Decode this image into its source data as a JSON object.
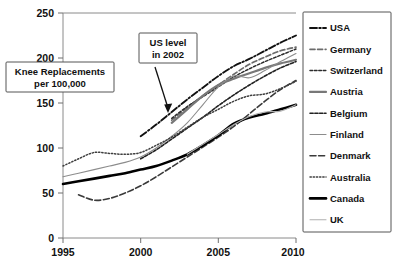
{
  "chart_data": {
    "type": "line",
    "title": "",
    "xlabel": "",
    "ylabel": "Knee Replacements per 100,000",
    "xlim": [
      1995,
      2010
    ],
    "ylim": [
      0,
      250
    ],
    "xticks": [
      "1995",
      "2000",
      "2005",
      "2010"
    ],
    "yticks": [
      "0",
      "50",
      "100",
      "150",
      "200",
      "250"
    ],
    "grid": false,
    "legend_position": "right",
    "annotations": [
      {
        "name": "us-level-2002",
        "line1": "US level",
        "line2": "in 2002",
        "points_to_x": 2002,
        "points_to_y": 140
      }
    ],
    "series": [
      {
        "name": "USA",
        "color": "#111111",
        "style": "dash-dot",
        "x": [
          2000,
          2001,
          2002,
          2003,
          2004,
          2005,
          2006,
          2007,
          2008,
          2009,
          2010
        ],
        "values": [
          113,
          126,
          140,
          154,
          167,
          180,
          191,
          199,
          208,
          217,
          225
        ]
      },
      {
        "name": "Germany",
        "color": "#6b6b6b",
        "style": "dashed",
        "x": [
          2002,
          2003,
          2004,
          2005,
          2006,
          2007,
          2008,
          2009,
          2010
        ],
        "values": [
          131,
          145,
          158,
          170,
          182,
          193,
          201,
          208,
          212
        ]
      },
      {
        "name": "Switzerland",
        "color": "#2b2b2b",
        "style": "fine-dash",
        "x": [
          2002,
          2003,
          2004,
          2005,
          2006,
          2007,
          2008,
          2009,
          2010
        ],
        "values": [
          133,
          146,
          157,
          168,
          179,
          188,
          196,
          203,
          210
        ]
      },
      {
        "name": "Austria",
        "color": "#787878",
        "style": "solid-thick",
        "x": [
          2002,
          2003,
          2004,
          2005,
          2006,
          2007,
          2008,
          2009,
          2010
        ],
        "values": [
          128,
          143,
          158,
          170,
          177,
          183,
          189,
          194,
          198
        ]
      },
      {
        "name": "Belgium",
        "color": "#222222",
        "style": "dotted-dash",
        "x": [
          2000,
          2001,
          2002,
          2003,
          2004,
          2005,
          2006,
          2007,
          2008,
          2009,
          2010
        ],
        "values": [
          88,
          98,
          110,
          122,
          134,
          147,
          159,
          170,
          180,
          189,
          196
        ]
      },
      {
        "name": "Finland",
        "color": "#8c8c8c",
        "style": "solid-thin",
        "x": [
          1995,
          1996,
          1997,
          1998,
          1999,
          2000,
          2001,
          2002,
          2003,
          2004,
          2005,
          2006,
          2007,
          2008,
          2009,
          2010
        ],
        "values": [
          68,
          72,
          76,
          80,
          84,
          90,
          100,
          113,
          128,
          148,
          168,
          180,
          178,
          186,
          196,
          205
        ]
      },
      {
        "name": "Denmark",
        "color": "#3a3a3a",
        "style": "long-dash",
        "x": [
          1996,
          1997,
          1998,
          1999,
          2000,
          2001,
          2002,
          2003,
          2004,
          2005,
          2006,
          2007,
          2008,
          2009,
          2010
        ],
        "values": [
          48,
          42,
          44,
          50,
          58,
          68,
          79,
          90,
          101,
          112,
          124,
          138,
          152,
          165,
          175
        ]
      },
      {
        "name": "Australia",
        "color": "#3f3f3f",
        "style": "dotted",
        "x": [
          1995,
          1996,
          1997,
          1998,
          1999,
          2000,
          2001,
          2002,
          2003,
          2004,
          2005,
          2006,
          2007,
          2008,
          2009,
          2010
        ],
        "values": [
          80,
          88,
          95,
          94,
          93,
          95,
          103,
          112,
          123,
          134,
          143,
          152,
          158,
          160,
          166,
          174
        ]
      },
      {
        "name": "Canada",
        "color": "#000000",
        "style": "solid-heavy",
        "x": [
          1995,
          1996,
          1997,
          1998,
          1999,
          2000,
          2001,
          2002,
          2003,
          2004,
          2005,
          2006,
          2007,
          2008,
          2009,
          2010
        ],
        "values": [
          60,
          63,
          66,
          69,
          72,
          76,
          80,
          86,
          93,
          103,
          114,
          127,
          134,
          138,
          143,
          148
        ]
      },
      {
        "name": "UK",
        "color": "#b0b0b0",
        "style": "solid-thin-light",
        "x": [
          2003,
          2004,
          2005,
          2006,
          2007,
          2008,
          2009,
          2010
        ],
        "values": [
          93,
          104,
          115,
          126,
          135,
          140,
          141,
          148
        ]
      }
    ]
  },
  "axis_label_box": {
    "line1": "Knee Replacements",
    "line2": "per 100,000"
  },
  "legend": {
    "items": [
      {
        "label": "USA"
      },
      {
        "label": "Germany"
      },
      {
        "label": "Switzerland"
      },
      {
        "label": "Austria"
      },
      {
        "label": "Belgium"
      },
      {
        "label": "Finland"
      },
      {
        "label": "Denmark"
      },
      {
        "label": "Australia"
      },
      {
        "label": "Canada"
      },
      {
        "label": "UK"
      }
    ]
  },
  "x_axis": {
    "labels": [
      "1995",
      "2000",
      "2005",
      "2010"
    ]
  },
  "y_axis": {
    "labels": [
      "250",
      "200",
      "150",
      "100",
      "50",
      "0"
    ]
  }
}
